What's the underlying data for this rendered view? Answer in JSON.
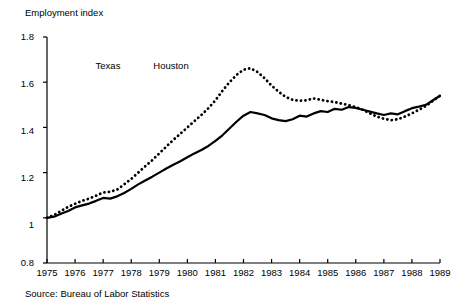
{
  "title": "Employment index",
  "source_note": "Source:  Bureau of Labor Statistics",
  "legend": {
    "entries": [
      {
        "label": "Texas",
        "style": "solid",
        "color": "#000000"
      },
      {
        "label": "Houston",
        "style": "dotted",
        "color": "#000000"
      }
    ]
  },
  "axes": {
    "y_ticks": [
      "0.8",
      "1",
      "1.2",
      "1.4",
      "1.6",
      "1.8"
    ],
    "x_ticks": [
      "1975",
      "1976",
      "1977",
      "1978",
      "1979",
      "1980",
      "1981",
      "1982",
      "1983",
      "1984",
      "1985",
      "1986",
      "1987",
      "1988",
      "1989"
    ]
  },
  "chart_data": {
    "type": "line",
    "title": "Employment index",
    "xlabel": "",
    "ylabel": "Employment index",
    "xlim": [
      1975,
      1989
    ],
    "ylim": [
      0.8,
      1.8
    ],
    "grid": false,
    "legend_position": "top-center",
    "y_tick_values": [
      0.8,
      1.0,
      1.2,
      1.4,
      1.6,
      1.8
    ],
    "x_tick_values": [
      1975,
      1976,
      1977,
      1978,
      1979,
      1980,
      1981,
      1982,
      1983,
      1984,
      1985,
      1986,
      1987,
      1988,
      1989
    ],
    "source": "Bureau of Labor Statistics",
    "x": [
      1975.0,
      1975.25,
      1975.5,
      1975.75,
      1976.0,
      1976.25,
      1976.5,
      1976.75,
      1977.0,
      1977.25,
      1977.5,
      1977.75,
      1978.0,
      1978.25,
      1978.5,
      1978.75,
      1979.0,
      1979.25,
      1979.5,
      1979.75,
      1980.0,
      1980.25,
      1980.5,
      1980.75,
      1981.0,
      1981.25,
      1981.5,
      1981.75,
      1982.0,
      1982.25,
      1982.5,
      1982.75,
      1983.0,
      1983.25,
      1983.5,
      1983.75,
      1984.0,
      1984.25,
      1984.5,
      1984.75,
      1985.0,
      1985.25,
      1985.5,
      1985.75,
      1986.0,
      1986.25,
      1986.5,
      1986.75,
      1987.0,
      1987.25,
      1987.5,
      1987.75,
      1988.0,
      1988.25,
      1988.5,
      1988.75,
      1989.0
    ],
    "series": [
      {
        "name": "Texas",
        "style": "solid",
        "color": "#000000",
        "values": [
          1.0,
          1.005,
          1.018,
          1.03,
          1.046,
          1.055,
          1.063,
          1.075,
          1.088,
          1.085,
          1.095,
          1.11,
          1.128,
          1.148,
          1.165,
          1.182,
          1.2,
          1.218,
          1.235,
          1.25,
          1.268,
          1.285,
          1.3,
          1.318,
          1.34,
          1.365,
          1.395,
          1.425,
          1.452,
          1.468,
          1.462,
          1.455,
          1.44,
          1.432,
          1.428,
          1.436,
          1.452,
          1.448,
          1.462,
          1.472,
          1.468,
          1.482,
          1.478,
          1.49,
          1.486,
          1.478,
          1.47,
          1.462,
          1.455,
          1.462,
          1.458,
          1.472,
          1.485,
          1.492,
          1.5,
          1.52,
          1.54
        ]
      },
      {
        "name": "Houston",
        "style": "dotted",
        "color": "#000000",
        "values": [
          1.0,
          1.012,
          1.03,
          1.048,
          1.062,
          1.075,
          1.085,
          1.098,
          1.112,
          1.115,
          1.125,
          1.148,
          1.172,
          1.2,
          1.228,
          1.255,
          1.285,
          1.315,
          1.345,
          1.372,
          1.4,
          1.428,
          1.455,
          1.485,
          1.52,
          1.562,
          1.6,
          1.632,
          1.655,
          1.662,
          1.645,
          1.618,
          1.585,
          1.558,
          1.535,
          1.522,
          1.518,
          1.52,
          1.528,
          1.522,
          1.516,
          1.512,
          1.505,
          1.498,
          1.49,
          1.478,
          1.462,
          1.448,
          1.438,
          1.432,
          1.436,
          1.448,
          1.462,
          1.478,
          1.495,
          1.518,
          1.54
        ]
      }
    ]
  }
}
